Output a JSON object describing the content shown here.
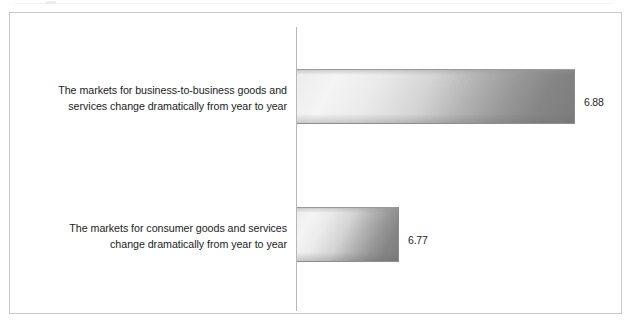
{
  "chart_data": {
    "type": "bar",
    "orientation": "horizontal",
    "title": "",
    "subtitle": "",
    "xlabel": "",
    "ylabel": "",
    "grid": false,
    "legend": null,
    "legend_position": "none",
    "axis_line_visible": true,
    "value_label_format": "0.00",
    "note": "Bar pixel lengths are not proportional to the values; the category axis is drawn as a bare vertical line with no tick labels or scale.",
    "categories": [
      "The markets for business-to-business goods and services change dramatically from year to year",
      "The markets for consumer goods and services change dramatically from year to year"
    ],
    "values": [
      6.88,
      6.77
    ],
    "value_labels": [
      "6.88",
      "6.77"
    ],
    "bars": [
      {
        "index": 0,
        "value": 6.88,
        "value_label": "6.88",
        "label_lines": [
          "The markets for business-to-business goods and",
          "services change dramatically from year to year"
        ],
        "pixel_length": 278
      },
      {
        "index": 1,
        "value": 6.77,
        "value_label": "6.77",
        "label_lines": [
          "The markets for consumer goods and services",
          "change dramatically from year to year"
        ],
        "pixel_length": 102
      }
    ]
  },
  "colors": {
    "background": "#ffffff",
    "frame_border": "#c9c9c9",
    "axis_line": "#b7b7b7",
    "bar_gradient_light": "#f4f4f4",
    "bar_gradient_dark": "#7c7c7c",
    "bar_outline": "#8a8a8a",
    "label_text": "#232323",
    "value_text": "#1f1f1f"
  }
}
